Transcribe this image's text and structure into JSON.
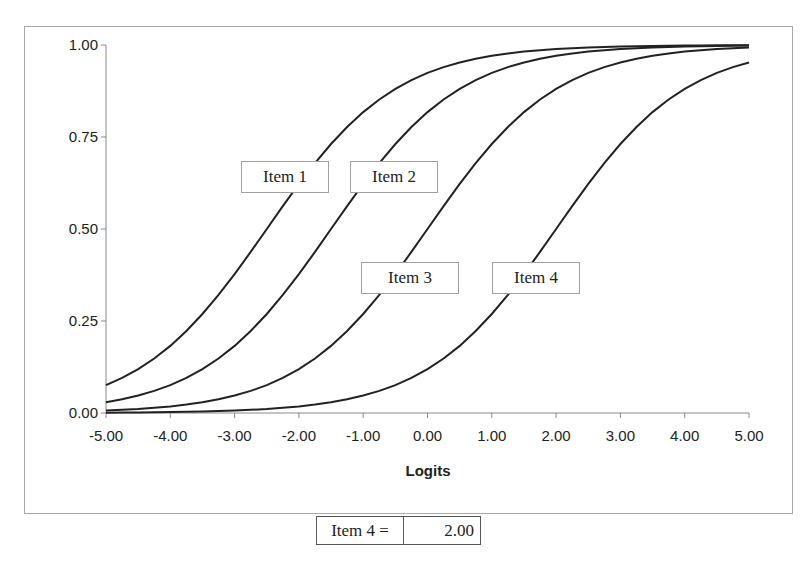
{
  "chart_data": {
    "type": "line",
    "title": "",
    "xlabel": "Logits",
    "ylabel": "",
    "xlim": [
      -5,
      5
    ],
    "ylim": [
      0,
      1
    ],
    "grid": false,
    "legend_position": "none",
    "x_ticks": [
      "-5.00",
      "-4.00",
      "-3.00",
      "-2.00",
      "-1.00",
      "0.00",
      "1.00",
      "2.00",
      "3.00",
      "4.00",
      "5.00"
    ],
    "y_ticks": [
      "0.00",
      "0.25",
      "0.50",
      "0.75",
      "1.00"
    ],
    "x": [
      -5,
      -4.5,
      -4,
      -3.5,
      -3,
      -2.5,
      -2,
      -1.5,
      -1,
      -0.5,
      0,
      0.5,
      1,
      1.5,
      2,
      2.5,
      3,
      3.5,
      4,
      4.5,
      5
    ],
    "series": [
      {
        "name": "Item 1",
        "difficulty": -2.5,
        "values": [
          0.08,
          0.12,
          0.18,
          0.27,
          0.38,
          0.5,
          0.62,
          0.73,
          0.82,
          0.88,
          0.92,
          0.95,
          0.97,
          0.98,
          0.99,
          0.99,
          1.0,
          1.0,
          1.0,
          1.0,
          1.0
        ]
      },
      {
        "name": "Item 2",
        "difficulty": -1.5,
        "values": [
          0.03,
          0.05,
          0.08,
          0.12,
          0.18,
          0.27,
          0.38,
          0.5,
          0.62,
          0.73,
          0.82,
          0.88,
          0.92,
          0.95,
          0.97,
          0.98,
          0.99,
          0.99,
          1.0,
          1.0,
          1.0
        ]
      },
      {
        "name": "Item 3",
        "difficulty": 0.0,
        "values": [
          0.01,
          0.01,
          0.02,
          0.03,
          0.05,
          0.08,
          0.12,
          0.18,
          0.27,
          0.38,
          0.5,
          0.62,
          0.73,
          0.82,
          0.88,
          0.92,
          0.95,
          0.97,
          0.98,
          0.99,
          0.99
        ]
      },
      {
        "name": "Item 4",
        "difficulty": 2.0,
        "values": [
          0.0,
          0.0,
          0.0,
          0.0,
          0.0,
          0.01,
          0.02,
          0.03,
          0.05,
          0.08,
          0.12,
          0.18,
          0.27,
          0.38,
          0.5,
          0.62,
          0.73,
          0.82,
          0.88,
          0.92,
          0.95
        ]
      }
    ],
    "annotations": [
      "Item 1",
      "Item 2",
      "Item 3",
      "Item 4"
    ]
  },
  "labels": {
    "item1": "Item 1",
    "item2": "Item 2",
    "item3": "Item 3",
    "item4": "Item 4"
  },
  "parameter": {
    "label": "Item 4 =",
    "value": "2.00"
  }
}
